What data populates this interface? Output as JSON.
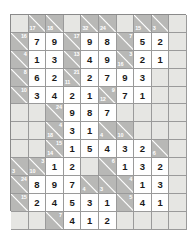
{
  "puzzle": {
    "type": "kakuro",
    "columns": 10,
    "rows": 11,
    "colors": {
      "clue_cell": "#b8b8b6",
      "blank_cell": "#e6e6e3",
      "entry_cell": "#ffffff",
      "grid_line": "#9a9a9a",
      "clue_text": "#ffffff",
      "entry_text": "#1a1a1a",
      "page_background": "#ffffff"
    },
    "cells": [
      [
        {
          "kind": "blank"
        },
        {
          "kind": "clue",
          "down": "17"
        },
        {
          "kind": "clue",
          "down": "18"
        },
        {
          "kind": "blank"
        },
        {
          "kind": "clue",
          "down": "32"
        },
        {
          "kind": "clue",
          "down": "24"
        },
        {
          "kind": "blank"
        },
        {
          "kind": "clue",
          "down": "15"
        },
        {
          "kind": "clue",
          "down": "3"
        },
        {
          "kind": "blank"
        }
      ],
      [
        {
          "kind": "clue",
          "across": "16"
        },
        {
          "kind": "entry",
          "value": "7"
        },
        {
          "kind": "entry",
          "value": "9"
        },
        {
          "kind": "clue",
          "across": "17"
        },
        {
          "kind": "entry",
          "value": "9"
        },
        {
          "kind": "entry",
          "value": "8"
        },
        {
          "kind": "clue",
          "across": "7"
        },
        {
          "kind": "entry",
          "value": "5"
        },
        {
          "kind": "entry",
          "value": "2"
        },
        {
          "kind": "blank"
        }
      ],
      [
        {
          "kind": "clue",
          "across": "4"
        },
        {
          "kind": "entry",
          "value": "1"
        },
        {
          "kind": "entry",
          "value": "3"
        },
        {
          "kind": "clue",
          "across": "13"
        },
        {
          "kind": "entry",
          "value": "4"
        },
        {
          "kind": "entry",
          "value": "9"
        },
        {
          "kind": "clue",
          "across": "3",
          "down": "16"
        },
        {
          "kind": "entry",
          "value": "2"
        },
        {
          "kind": "entry",
          "value": "1"
        },
        {
          "kind": "blank"
        }
      ],
      [
        {
          "kind": "clue",
          "across": "8"
        },
        {
          "kind": "entry",
          "value": "6"
        },
        {
          "kind": "entry",
          "value": "2"
        },
        {
          "kind": "clue",
          "across": "21",
          "down": "11"
        },
        {
          "kind": "entry",
          "value": "2"
        },
        {
          "kind": "entry",
          "value": "7"
        },
        {
          "kind": "entry",
          "value": "9"
        },
        {
          "kind": "entry",
          "value": "3"
        },
        {
          "kind": "blank"
        },
        {
          "kind": "blank"
        }
      ],
      [
        {
          "kind": "clue",
          "across": "10"
        },
        {
          "kind": "entry",
          "value": "3"
        },
        {
          "kind": "entry",
          "value": "4"
        },
        {
          "kind": "entry",
          "value": "2"
        },
        {
          "kind": "entry",
          "value": "1"
        },
        {
          "kind": "clue",
          "across": "9",
          "down": "12"
        },
        {
          "kind": "entry",
          "value": "7"
        },
        {
          "kind": "entry",
          "value": "1"
        },
        {
          "kind": "blank"
        },
        {
          "kind": "blank"
        }
      ],
      [
        {
          "kind": "blank"
        },
        {
          "kind": "blank"
        },
        {
          "kind": "clue",
          "across": "24"
        },
        {
          "kind": "entry",
          "value": "9"
        },
        {
          "kind": "entry",
          "value": "8"
        },
        {
          "kind": "entry",
          "value": "7"
        },
        {
          "kind": "blank"
        },
        {
          "kind": "blank"
        },
        {
          "kind": "blank"
        },
        {
          "kind": "blank"
        }
      ],
      [
        {
          "kind": "blank"
        },
        {
          "kind": "blank"
        },
        {
          "kind": "clue",
          "across": "4",
          "down": "18"
        },
        {
          "kind": "entry",
          "value": "3"
        },
        {
          "kind": "entry",
          "value": "1"
        },
        {
          "kind": "clue",
          "down": "4"
        },
        {
          "kind": "clue",
          "down": "10"
        },
        {
          "kind": "blank"
        },
        {
          "kind": "blank"
        },
        {
          "kind": "blank"
        }
      ],
      [
        {
          "kind": "blank"
        },
        {
          "kind": "blank"
        },
        {
          "kind": "clue",
          "across": "15",
          "down": "14"
        },
        {
          "kind": "entry",
          "value": "1"
        },
        {
          "kind": "entry",
          "value": "5"
        },
        {
          "kind": "entry",
          "value": "4"
        },
        {
          "kind": "entry",
          "value": "3"
        },
        {
          "kind": "entry",
          "value": "2"
        },
        {
          "kind": "clue",
          "down": "6"
        },
        {
          "kind": "blank"
        }
      ],
      [
        {
          "kind": "clue",
          "down": "3"
        },
        {
          "kind": "clue",
          "across": "3",
          "down": "10"
        },
        {
          "kind": "entry",
          "value": "1"
        },
        {
          "kind": "entry",
          "value": "2"
        },
        {
          "kind": "blank"
        },
        {
          "kind": "clue",
          "across": "6"
        },
        {
          "kind": "entry",
          "value": "1"
        },
        {
          "kind": "entry",
          "value": "3"
        },
        {
          "kind": "entry",
          "value": "2"
        },
        {
          "kind": "blank"
        }
      ],
      [
        {
          "kind": "clue",
          "across": "24"
        },
        {
          "kind": "entry",
          "value": "8"
        },
        {
          "kind": "entry",
          "value": "9"
        },
        {
          "kind": "entry",
          "value": "7"
        },
        {
          "kind": "clue",
          "down": "4"
        },
        {
          "kind": "clue",
          "down": "3"
        },
        {
          "kind": "clue",
          "across": "4"
        },
        {
          "kind": "entry",
          "value": "1"
        },
        {
          "kind": "entry",
          "value": "3"
        },
        {
          "kind": "blank"
        }
      ],
      [
        {
          "kind": "clue",
          "across": "15"
        },
        {
          "kind": "entry",
          "value": "2"
        },
        {
          "kind": "entry",
          "value": "4"
        },
        {
          "kind": "entry",
          "value": "5"
        },
        {
          "kind": "entry",
          "value": "3"
        },
        {
          "kind": "entry",
          "value": "1"
        },
        {
          "kind": "clue",
          "across": "5"
        },
        {
          "kind": "entry",
          "value": "4"
        },
        {
          "kind": "entry",
          "value": "1"
        },
        {
          "kind": "blank"
        }
      ],
      [
        {
          "kind": "blank"
        },
        {
          "kind": "blank"
        },
        {
          "kind": "clue",
          "across": "7"
        },
        {
          "kind": "entry",
          "value": "4"
        },
        {
          "kind": "entry",
          "value": "1"
        },
        {
          "kind": "entry",
          "value": "2"
        },
        {
          "kind": "blank"
        },
        {
          "kind": "blank"
        },
        {
          "kind": "blank"
        },
        {
          "kind": "blank"
        }
      ]
    ]
  }
}
